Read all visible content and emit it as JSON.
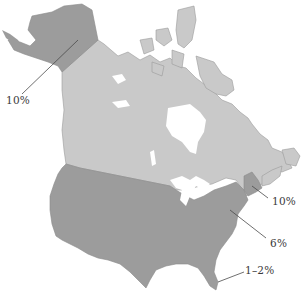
{
  "map": {
    "colors": {
      "canada": "#c9c9c9",
      "us": "#9c9c9c",
      "stroke": "#8a8a8a",
      "water": "#ffffff",
      "leader": "#4a4a4a",
      "label": "#3a3a3a"
    },
    "regions": [
      {
        "name": "Alaska",
        "shade": "dark"
      },
      {
        "name": "Canada",
        "shade": "light"
      },
      {
        "name": "Contiguous United States",
        "shade": "dark"
      },
      {
        "name": "New England",
        "shade": "dark"
      },
      {
        "name": "Florida",
        "shade": "dark"
      }
    ],
    "labels": {
      "alaska": "10%",
      "new_england": "10%",
      "eastern_us": "6%",
      "florida": "1–2%"
    }
  }
}
